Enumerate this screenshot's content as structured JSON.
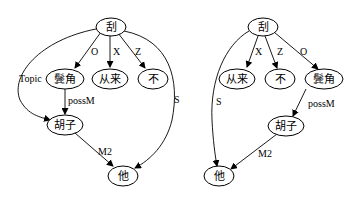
{
  "diagrams": [
    {
      "name": "left-tree",
      "nodes": {
        "gua": {
          "label": "刮"
        },
        "binjiao": {
          "label": "鬓角"
        },
        "conglai": {
          "label": "从来"
        },
        "bu": {
          "label": "不"
        },
        "huzi": {
          "label": "胡子"
        },
        "ta": {
          "label": "他"
        }
      },
      "edges": {
        "gua_binjiao": {
          "label": "O"
        },
        "gua_conglai": {
          "label": "X"
        },
        "gua_bu": {
          "label": "Z"
        },
        "gua_huzi": {
          "label": "Topic"
        },
        "gua_ta": {
          "label": "S"
        },
        "binjiao_huzi": {
          "label": "possM"
        },
        "huzi_ta": {
          "label": "M2"
        }
      }
    },
    {
      "name": "right-tree",
      "nodes": {
        "gua": {
          "label": "刮"
        },
        "conglai": {
          "label": "从来"
        },
        "bu": {
          "label": "不"
        },
        "binjiao": {
          "label": "鬓角"
        },
        "huzi": {
          "label": "胡子"
        },
        "ta": {
          "label": "他"
        }
      },
      "edges": {
        "gua_conglai": {
          "label": "X"
        },
        "gua_bu": {
          "label": "Z"
        },
        "gua_binjiao": {
          "label": "O"
        },
        "gua_ta": {
          "label": "S"
        },
        "binjiao_huzi": {
          "label": "possM"
        },
        "huzi_ta": {
          "label": "M2"
        }
      }
    }
  ]
}
